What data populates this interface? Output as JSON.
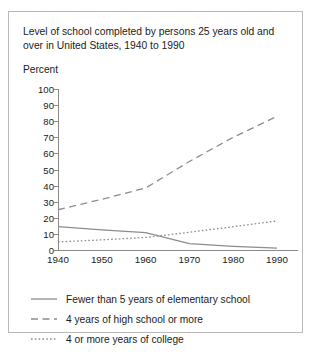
{
  "figure": {
    "title": "Level of school completed by persons 25 years old and over in United States, 1940 to 1990"
  },
  "chart_data": {
    "type": "line",
    "title": "Level of school completed by persons 25 years old and over in United States, 1940 to 1990",
    "xlabel": "",
    "ylabel": "Percent",
    "xlim": [
      1940,
      1990
    ],
    "ylim": [
      0,
      100
    ],
    "grid": false,
    "legend_position": "below-plot",
    "x_ticks": [
      "1940",
      "1950",
      "1960",
      "1970",
      "1980",
      "1990"
    ],
    "y_ticks": [
      "0",
      "10",
      "20",
      "30",
      "40",
      "50",
      "60",
      "70",
      "80",
      "90",
      "100"
    ],
    "x": [
      1940,
      1950,
      1960,
      1970,
      1980,
      1990
    ],
    "series": [
      {
        "name": "Fewer than 5 years of elementary school",
        "style": "solid",
        "color": "#8c8c8c",
        "values": [
          14.5,
          12.5,
          10.8,
          4.0,
          2.3,
          1.2
        ]
      },
      {
        "name": "4 years of high school or more",
        "style": "dashed",
        "color": "#8c8c8c",
        "values": [
          25.0,
          31.5,
          38.5,
          55.0,
          70.0,
          83.0
        ]
      },
      {
        "name": "4 or more years of college",
        "style": "dotted",
        "color": "#8c8c8c",
        "values": [
          5.0,
          6.3,
          7.8,
          11.0,
          14.5,
          18.0
        ]
      }
    ]
  },
  "legend": {
    "items": [
      {
        "label": "Fewer than 5 years of elementary school",
        "style": "solid"
      },
      {
        "label": "4 years of high school or more",
        "style": "dashed"
      },
      {
        "label": "4 or more years of college",
        "style": "dotted"
      }
    ]
  }
}
